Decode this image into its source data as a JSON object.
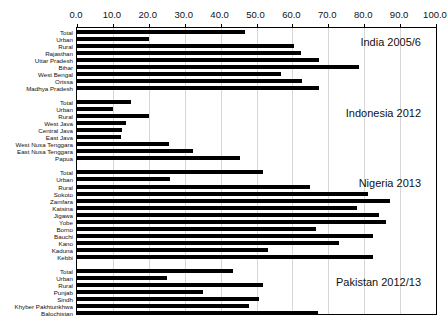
{
  "chart_data": {
    "type": "bar",
    "orientation": "horizontal",
    "title": "",
    "xlabel": "",
    "ylabel": "",
    "xlim": [
      0,
      100
    ],
    "grid": true,
    "legend": "none",
    "tick_labels": [
      "0.0",
      "10.0",
      "20.0",
      "30.0",
      "40.0",
      "50.0",
      "60.0",
      "70.0",
      "80.0",
      "90.0",
      "100.0"
    ],
    "tick_values": [
      0,
      10,
      20,
      30,
      40,
      50,
      60,
      70,
      80,
      90,
      100
    ],
    "sections": [
      {
        "name": "India 2005/6",
        "categories": [
          "Total",
          "Urban",
          "Rural",
          "Rajasthan",
          "Uttar Pradesh",
          "Bihar",
          "West Bengal",
          "Orissa",
          "Madhya Pradesh"
        ],
        "values": [
          46.8,
          20.0,
          60.5,
          62.3,
          67.5,
          78.5,
          56.8,
          62.8,
          67.3
        ]
      },
      {
        "name": "Indonesia 2012",
        "categories": [
          "Total",
          "Urban",
          "Rural",
          "West Java",
          "Central Java",
          "East Java",
          "West Nusa Tenggara",
          "East Nusa Tenggara",
          "Papua"
        ],
        "values": [
          15.0,
          10.0,
          20.0,
          13.6,
          12.4,
          12.2,
          25.6,
          32.2,
          45.4
        ]
      },
      {
        "name": "Nigeria 2013",
        "categories": [
          "Total",
          "Urban",
          "Rural",
          "Sokoto",
          "Zamfara",
          "Katsina",
          "Jigawa",
          "Yobe",
          "Borno",
          "Bauchi",
          "Kano",
          "Kaduna",
          "Kebbi"
        ],
        "values": [
          51.9,
          26.0,
          64.8,
          81.0,
          87.2,
          78.1,
          84.0,
          86.0,
          66.6,
          82.4,
          72.9,
          53.3,
          82.4
        ]
      },
      {
        "name": "Pakistan 2012/13",
        "categories": [
          "Total",
          "Urban",
          "Rural",
          "Punjab",
          "Sindh",
          "Khyber Pakhtunkhwa",
          "Balochistan"
        ],
        "values": [
          43.5,
          25.0,
          51.9,
          35.0,
          50.6,
          47.9,
          67.0
        ]
      }
    ]
  },
  "bar_color": "#000000",
  "gridline_color": "#d7d7d7",
  "frame_color": "#000000",
  "caption": ""
}
